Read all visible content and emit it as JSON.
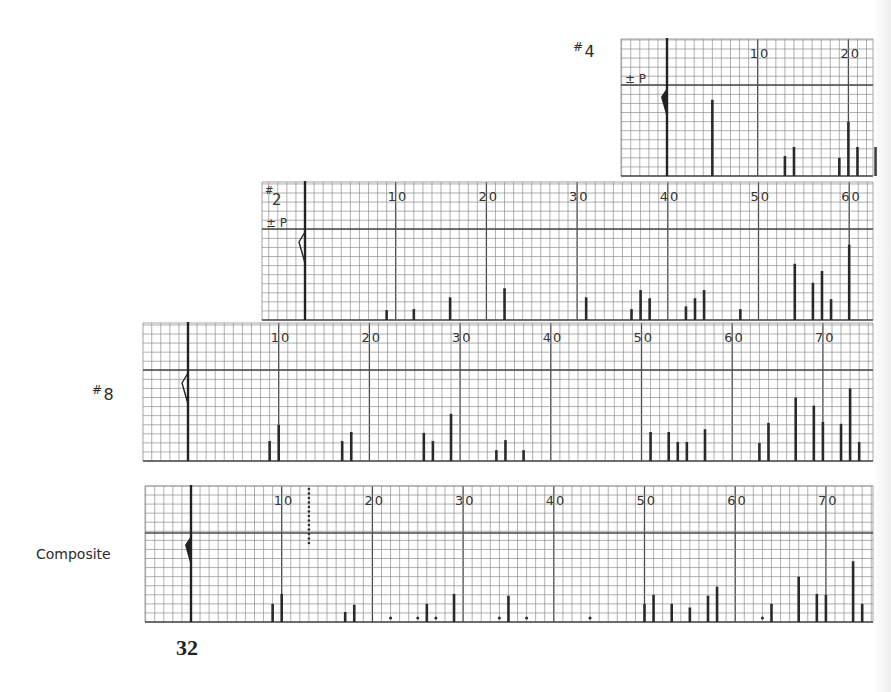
{
  "page": {
    "page_number": "32",
    "composite_label": "Composite"
  },
  "colors": {
    "grid_minor": "#8e8e8e",
    "grid_major": "#4a4a4a",
    "bar": "#2a2a2a",
    "background": "#ffffff"
  },
  "chart_data": [
    {
      "type": "bar",
      "title": "#4",
      "label_hash": "#",
      "label_num": "4",
      "p_label": "± P",
      "marker": "filled",
      "tick_labels": [
        "10",
        "20"
      ],
      "xlabel": "",
      "ylabel": "",
      "grid": true,
      "x": [
        5,
        13,
        14,
        19,
        20,
        21,
        23
      ],
      "values": [
        8.4,
        2.2,
        3.2,
        2.0,
        6.0,
        3.2,
        3.2
      ],
      "dots": []
    },
    {
      "type": "bar",
      "title": "#2",
      "label_hash": "#",
      "label_num": "2",
      "p_label": "± P",
      "marker": "outline",
      "tick_labels": [
        "10",
        "20",
        "30",
        "40",
        "50",
        "60"
      ],
      "xlabel": "",
      "ylabel": "",
      "grid": true,
      "x": [
        9,
        12,
        16,
        22,
        31,
        36,
        37,
        38,
        42,
        43,
        44,
        48,
        54,
        56,
        57,
        58,
        60
      ],
      "values": [
        1.1,
        1.2,
        2.5,
        3.5,
        2.5,
        1.2,
        3.3,
        2.4,
        1.5,
        2.4,
        3.3,
        1.2,
        6.2,
        4.1,
        5.4,
        2.3,
        8.3
      ],
      "dots": []
    },
    {
      "type": "bar",
      "title": "#8",
      "label_hash": "#",
      "label_num": "8",
      "p_label": "",
      "marker": "outline",
      "tick_labels": [
        "10",
        "20",
        "30",
        "40",
        "50",
        "60",
        "70"
      ],
      "xlabel": "",
      "ylabel": "",
      "grid": true,
      "x": [
        9,
        10,
        17,
        18,
        26,
        27,
        29,
        34,
        35,
        37,
        51,
        53,
        54,
        55,
        57,
        63,
        64,
        67,
        69,
        70,
        72,
        73,
        74
      ],
      "values": [
        2.2,
        4.0,
        2.2,
        3.2,
        3.1,
        2.2,
        5.2,
        1.2,
        2.3,
        1.2,
        3.2,
        3.2,
        2.1,
        2.1,
        3.5,
        2.0,
        4.2,
        7.0,
        6.1,
        4.3,
        4.1,
        8.0,
        2.1
      ],
      "dots": []
    },
    {
      "type": "bar",
      "title": "Composite",
      "label_hash": "",
      "label_num": "",
      "p_label": "",
      "marker": "filled",
      "tick_labels": [
        "10",
        "20",
        "30",
        "40",
        "50",
        "60",
        "70"
      ],
      "xlabel": "",
      "ylabel": "",
      "grid": true,
      "x": [
        9,
        10,
        17,
        18,
        26,
        29,
        35,
        50,
        51,
        53,
        55,
        57,
        58,
        64,
        67,
        69,
        70,
        73,
        74
      ],
      "values": [
        2.0,
        3.1,
        1.1,
        1.9,
        2.0,
        3.1,
        2.9,
        2.0,
        3.0,
        2.0,
        1.6,
        2.9,
        3.9,
        2.0,
        5.0,
        3.1,
        3.0,
        6.7,
        2.0
      ],
      "dots": [
        22,
        25,
        27,
        34,
        37,
        44,
        63
      ],
      "dotted_line_at": 13
    }
  ]
}
